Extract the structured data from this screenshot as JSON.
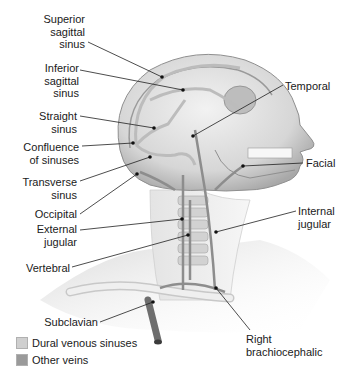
{
  "diagram": {
    "labels_left": [
      {
        "id": "superior-sagittal-sinus",
        "text": "Superior\nsagittal\nsinus"
      },
      {
        "id": "inferior-sagittal-sinus",
        "text": "Inferior\nsagittal\nsinus"
      },
      {
        "id": "straight-sinus",
        "text": "Straight\nsinus"
      },
      {
        "id": "confluence-of-sinuses",
        "text": "Confluence\nof sinuses"
      },
      {
        "id": "transverse-sinus",
        "text": "Transverse\nsinus"
      },
      {
        "id": "occipital",
        "text": "Occipital"
      },
      {
        "id": "external-jugular",
        "text": "External\njugular"
      },
      {
        "id": "vertebral",
        "text": "Vertebral"
      },
      {
        "id": "subclavian",
        "text": "Subclavian"
      }
    ],
    "labels_right": [
      {
        "id": "temporal",
        "text": "Temporal"
      },
      {
        "id": "facial",
        "text": "Facial"
      },
      {
        "id": "internal-jugular",
        "text": "Internal\njugular"
      },
      {
        "id": "right-brachiocephalic",
        "text": "Right\nbrachiocephalic"
      }
    ]
  },
  "legend": {
    "items": [
      {
        "label": "Dural venous sinuses",
        "color": "#cfcfcf"
      },
      {
        "label": "Other veins",
        "color": "#9a9a9a"
      }
    ]
  }
}
